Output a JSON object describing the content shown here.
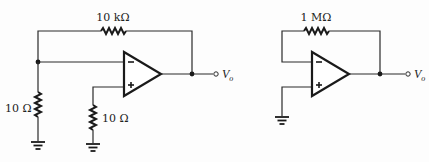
{
  "circuits": [
    {
      "id": "left",
      "description": "Non-inverting amplifier with input grounded through resistor",
      "feedback_resistor": {
        "label": "10 kΩ"
      },
      "ground_resistor": {
        "label": "10 Ω"
      },
      "noninverting_resistor": {
        "label": "10 Ω"
      },
      "opamp": {
        "minus": "−",
        "plus": "+"
      },
      "output": {
        "symbol": "V",
        "subscript": "o"
      }
    },
    {
      "id": "right",
      "description": "Op-amp with feedback resistor, non-inverting input grounded",
      "feedback_resistor": {
        "label": "1 MΩ"
      },
      "opamp": {
        "minus": "−",
        "plus": "+"
      },
      "output": {
        "symbol": "V",
        "subscript": "o"
      }
    }
  ]
}
